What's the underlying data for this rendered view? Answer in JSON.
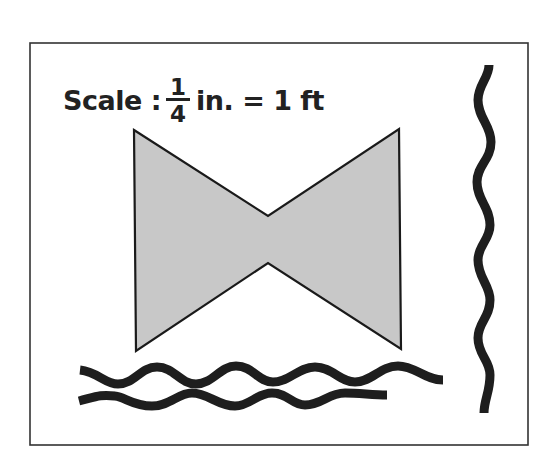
{
  "figure": {
    "frame": {
      "x": 30,
      "y": 43,
      "width": 498,
      "height": 402,
      "stroke": "#333333"
    },
    "scale_label": {
      "prefix": "Scale :",
      "fraction": {
        "numerator": "1",
        "denominator": "4"
      },
      "suffix": "in. = 1 ft"
    },
    "bowtie": {
      "points": "134,130 268,216 399,129 401,349 268,263 136,351",
      "fill": "#c8c8c8",
      "stroke": "#1a1a1a"
    },
    "waves": {
      "color": "#1e1e1e",
      "top_horizontal": "M80,370 C98,372 105,384 118,384 C135,384 140,367 157,367 C174,367 180,384 196,384 C213,384 220,366 236,366 C253,366 258,382 273,382 C290,382 298,367 315,367 C332,367 340,382 355,382 C372,382 380,366 398,366 C415,366 425,380 443,380",
      "bottom_horizontal": "M79,401 C95,397 100,394 115,396 C125,397 133,406 152,406 C170,406 178,393 192,393 C208,393 218,406 235,406 C250,406 257,393 272,393 C288,393 292,405 305,405 C322,405 328,393 345,393 C360,393 372,395 387,395",
      "right_vertical": "M489,65 C489,78 478,85 478,100 C478,118 491,125 491,142 C491,160 477,165 477,182 C477,200 490,207 490,225 C490,240 478,245 478,260 C478,278 490,285 490,300 C490,318 478,322 478,338 C478,355 490,360 490,375 C490,392 484,400 484,413"
    }
  }
}
